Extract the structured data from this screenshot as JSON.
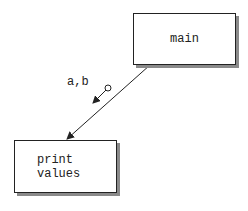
{
  "diagram": {
    "type": "structure-chart",
    "modules": [
      {
        "id": "main",
        "label": "main"
      },
      {
        "id": "print-values",
        "label_lines": [
          "print",
          "values"
        ]
      }
    ],
    "connections": [
      {
        "from": "main",
        "to": "print-values",
        "couples": [
          {
            "label": "a,b",
            "kind": "data-couple",
            "direction": "down"
          }
        ]
      }
    ]
  },
  "modules": {
    "main": {
      "label": "main"
    },
    "print": {
      "line1": "print",
      "line2": "values"
    }
  },
  "couple": {
    "label": "a,b"
  }
}
